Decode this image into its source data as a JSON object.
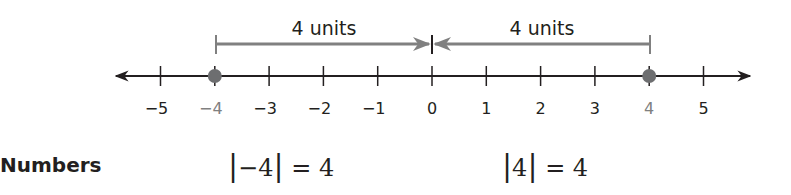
{
  "number_line": {
    "min": -5,
    "max": 5,
    "ticks": [
      "−5",
      "−4",
      "−3",
      "−2",
      "−1",
      "0",
      "1",
      "2",
      "3",
      "4",
      "5"
    ],
    "highlighted_points": [
      -4,
      4
    ],
    "point_color": "#6d6e70",
    "axis_color": "#231f20"
  },
  "brackets": [
    {
      "label": "4 units",
      "from": -4,
      "to": 0,
      "arrow_at": "right"
    },
    {
      "label": "4 units",
      "from": 4,
      "to": 0,
      "arrow_at": "left"
    }
  ],
  "row": {
    "label": "Numbers",
    "expressions": [
      "|−4| = 4",
      "|4| = 4"
    ]
  }
}
